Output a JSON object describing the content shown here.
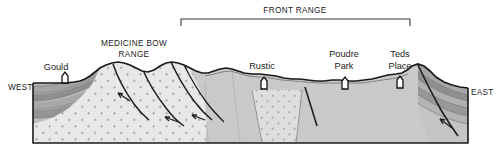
{
  "figure": {
    "type": "geologic-cross-section",
    "orientation_labels": {
      "left": "WEST",
      "right": "EAST"
    },
    "range_brackets": [
      {
        "id": "front-range",
        "label": "FRONT RANGE",
        "x_start": 181,
        "x_end": 410,
        "label_x": 295,
        "label_y": 13,
        "bracket_y": 19,
        "tick_height": 7
      }
    ],
    "range_labels": [
      {
        "id": "medicine-bow-range",
        "lines": [
          "MEDICINE BOW",
          "RANGE"
        ],
        "x": 134,
        "y": 46
      }
    ],
    "towns": [
      {
        "id": "gould",
        "label": "Gould",
        "label_x": 56,
        "label_y": 70,
        "marker_x": 65,
        "marker_y": 83
      },
      {
        "id": "rustic",
        "label": "Rustic",
        "label_x": 262,
        "label_y": 69,
        "marker_x": 264,
        "marker_y": 89
      },
      {
        "id": "poudre-park",
        "lines": [
          "Poudre",
          "Park"
        ],
        "label_x": 344,
        "label_y": 57,
        "marker_x": 345,
        "marker_y": 89
      },
      {
        "id": "teds-place",
        "lines": [
          "Teds",
          "Place"
        ],
        "label_x": 400,
        "label_y": 57,
        "marker_x": 400,
        "marker_y": 88
      }
    ],
    "colors": {
      "granite": "#e8e8e8",
      "basement": "#c9c9c9",
      "sediment_light": "#c4c4c4",
      "sediment_mid": "#a8a8a8",
      "sediment_dark": "#8f8f8f",
      "outline": "#1a1a1a",
      "fault": "#222222",
      "background": "#ffffff"
    },
    "units": [
      {
        "id": "granite-medicine-bow",
        "name": "granite (stippled)"
      },
      {
        "id": "basement-front-range",
        "name": "crystalline basement"
      },
      {
        "id": "granite-intrusion-rustic",
        "name": "granite intrusion"
      },
      {
        "id": "sedimentary-west",
        "name": "west sedimentary layers"
      },
      {
        "id": "sedimentary-east",
        "name": "east dipping sedimentary layers"
      }
    ],
    "faults": [
      {
        "id": "fault-west-1",
        "sense": "thrust"
      },
      {
        "id": "fault-west-2",
        "sense": "thrust"
      },
      {
        "id": "fault-west-3",
        "sense": "thrust"
      },
      {
        "id": "fault-west-4",
        "sense": "thrust"
      },
      {
        "id": "fault-central",
        "sense": "normal"
      },
      {
        "id": "fault-east-teds",
        "sense": "thrust"
      }
    ]
  }
}
